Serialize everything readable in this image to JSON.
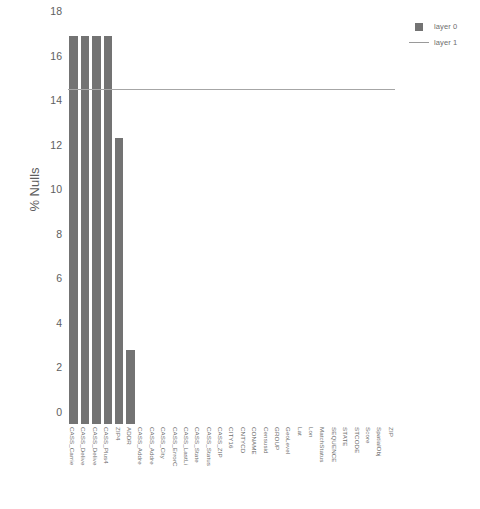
{
  "chart_data": {
    "type": "bar",
    "title": "",
    "xlabel": "",
    "ylabel": "% Nulls",
    "ylim": [
      0,
      18
    ],
    "yticks": [
      0,
      2,
      4,
      6,
      8,
      10,
      12,
      14,
      16,
      18
    ],
    "grid": false,
    "legend_position": "top-right",
    "categories": [
      "CASS_Carrie",
      "CASS_Delive",
      "CASS_Delive",
      "CASS_Plus4",
      "ZIP4",
      "ADDR",
      "CASS_Addre",
      "CASS_Addre",
      "CASS_City",
      "CASS_ErrorC",
      "CASS_LastLi",
      "CASS_State",
      "CASS_Status",
      "CASS_ZIP",
      "CITY16",
      "CNTYCD",
      "CONAME",
      "Censusid",
      "GROUP",
      "GeoLevel",
      "Lat",
      "Lon",
      "MatchStatus",
      "SEQUENCE",
      "STATE",
      "STCODE",
      "Score",
      "SpatialObj",
      "ZIP"
    ],
    "series": [
      {
        "name": "layer 0",
        "type": "bar",
        "color": "#737373",
        "values": [
          17.4,
          17.4,
          17.4,
          17.4,
          12.85,
          3.3,
          0,
          0,
          0,
          0,
          0,
          0,
          0,
          0,
          0,
          0,
          0,
          0,
          0,
          0,
          0,
          0,
          0,
          0,
          0,
          0,
          0,
          0,
          0
        ]
      },
      {
        "name": "layer 1",
        "type": "line",
        "color": "#a6a6a6",
        "constant_value": 15.0,
        "x_extent_fraction": 0.99
      }
    ]
  },
  "legend": {
    "items": [
      {
        "label": "layer 0",
        "key": "square-swatch"
      },
      {
        "label": "layer 1",
        "key": "line-swatch"
      }
    ]
  },
  "axes": {
    "y_title": "% Nulls",
    "y_tick_labels": [
      "0",
      "2",
      "4",
      "6",
      "8",
      "10",
      "12",
      "14",
      "16",
      "18"
    ]
  },
  "colors": {
    "bar": "#737373",
    "line": "#a6a6a6",
    "text": "#5e5e5e",
    "background": "#ffffff"
  }
}
